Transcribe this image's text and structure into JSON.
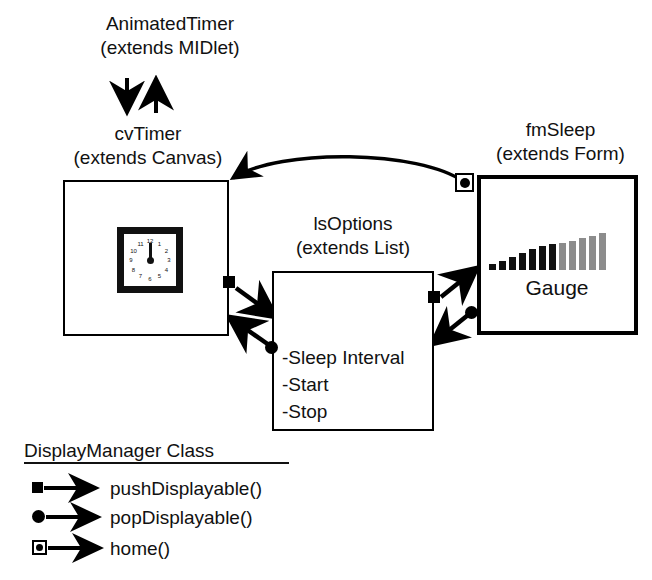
{
  "diagram": {
    "classes": [
      {
        "id": "animatedtimer",
        "name": "AnimatedTimer",
        "extends_line": "(extends MIDlet)",
        "has_box": false
      },
      {
        "id": "cvtimer",
        "name": "cvTimer",
        "extends_line": "(extends Canvas)",
        "has_box": true,
        "content": "clock-widget"
      },
      {
        "id": "lsoptions",
        "name": "lsOptions",
        "extends_line": "(extends List)",
        "has_box": true,
        "items": [
          "-Sleep Interval",
          "-Start",
          "-Stop"
        ]
      },
      {
        "id": "fmsleep",
        "name": "fmSleep",
        "extends_line": "(extends Form)",
        "has_box": true,
        "content": "gauge-widget",
        "gauge_label": "Gauge"
      }
    ],
    "clock": {
      "numbers": [
        "12",
        "1",
        "2",
        "3",
        "4",
        "5",
        "6",
        "7",
        "8",
        "9",
        "10",
        "11"
      ],
      "hand_points_to": "12"
    },
    "gauge": {
      "bar_count": 12,
      "filled_count": 7,
      "filled_color": "#111111",
      "empty_color": "#8c8c8c",
      "bar_heights_px": [
        6,
        9,
        13,
        17,
        21,
        24,
        26,
        27,
        29,
        32,
        34,
        37
      ]
    }
  },
  "legend": {
    "title": "DisplayManager Class",
    "entries": [
      {
        "marker": "filled-square-marker",
        "label": "pushDisplayable()"
      },
      {
        "marker": "filled-circle-marker",
        "label": "popDisplayable()"
      },
      {
        "marker": "square-with-dot-marker",
        "label": "home()"
      }
    ]
  },
  "connections": [
    {
      "from": "animatedtimer",
      "to": "cvtimer",
      "kind": "plain-arrow-down"
    },
    {
      "from": "cvtimer",
      "to": "animatedtimer",
      "kind": "plain-arrow-up"
    },
    {
      "from": "cvtimer",
      "to": "lsoptions",
      "kind": "pushDisplayable()"
    },
    {
      "from": "lsoptions",
      "to": "cvtimer",
      "kind": "popDisplayable()"
    },
    {
      "from": "lsoptions",
      "to": "fmsleep",
      "kind": "pushDisplayable()"
    },
    {
      "from": "fmsleep",
      "to": "lsoptions",
      "kind": "popDisplayable()"
    },
    {
      "from": "fmsleep",
      "to": "cvtimer",
      "kind": "home()"
    }
  ]
}
